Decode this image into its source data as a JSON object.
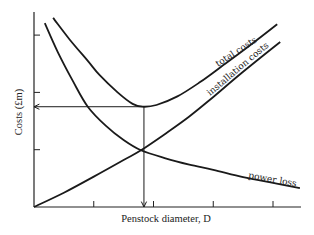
{
  "chart_data": {
    "type": "line",
    "title": "",
    "xlabel": "Penstock diameter, D",
    "ylabel": "Costs (£m)",
    "xlim": [
      0,
      4.5
    ],
    "ylim": [
      0,
      3.4
    ],
    "x_ticks": [
      1,
      2,
      3,
      4
    ],
    "y_ticks": [
      1,
      2,
      3
    ],
    "tick_labels_shown": false,
    "grid": false,
    "legend": "inline labels on curves",
    "series": [
      {
        "name": "total costs",
        "x": [
          0.32,
          0.6,
          0.9,
          1.1,
          1.4,
          1.65,
          1.82,
          2.05,
          2.4,
          2.78,
          3.2,
          3.65,
          4.07
        ],
        "y": [
          3.3,
          2.92,
          2.55,
          2.3,
          2.0,
          1.8,
          1.75,
          1.78,
          1.93,
          2.18,
          2.5,
          2.85,
          3.19
        ]
      },
      {
        "name": "installation costs",
        "x": [
          0.0,
          0.5,
          1.0,
          1.5,
          1.79,
          2.2,
          2.6,
          3.0,
          3.5,
          4.12
        ],
        "y": [
          0.0,
          0.25,
          0.53,
          0.82,
          0.99,
          1.28,
          1.58,
          1.92,
          2.36,
          2.88
        ]
      },
      {
        "name": "power loss",
        "x": [
          0.18,
          0.4,
          0.65,
          0.9,
          1.2,
          1.5,
          1.79,
          2.2,
          2.6,
          3.0,
          3.5,
          4.0,
          4.45
        ],
        "y": [
          3.21,
          2.7,
          2.2,
          1.75,
          1.42,
          1.17,
          0.99,
          0.85,
          0.74,
          0.65,
          0.52,
          0.42,
          0.33
        ]
      }
    ],
    "annotations": [
      {
        "type": "arrow",
        "from": [
          1.84,
          1.75
        ],
        "to": [
          0.0,
          1.75
        ],
        "note": "minimum total cost read across to cost axis"
      },
      {
        "type": "arrow",
        "from": [
          1.84,
          1.75
        ],
        "to": [
          1.84,
          0.0
        ],
        "note": "optimum penstock diameter read down to D axis"
      }
    ]
  },
  "labels": {
    "total": "total costs",
    "installation": "installation costs",
    "power": "power loss",
    "xlabel": "Penstock diameter, D",
    "ylabel_main": "Costs (£m)"
  },
  "colors": {
    "ink": "#1a1a1a",
    "background": "#ffffff"
  }
}
